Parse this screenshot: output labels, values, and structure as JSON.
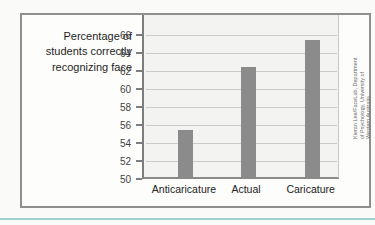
{
  "page": {
    "background": "#fafaf9",
    "bottom_rule_color": "#9fd1cd"
  },
  "figure": {
    "border_color": "#8f8f8f",
    "ylabel_lines": [
      "Percentage of",
      "students correctly",
      "recognizing face"
    ],
    "credit_lines": [
      "Kieran Lee/FaceLab, Department",
      "of Psychology, University of",
      "Western Australia"
    ]
  },
  "chart_data": {
    "type": "bar",
    "title": "",
    "xlabel": "",
    "ylabel": "Percentage of students correctly recognizing face",
    "categories": [
      "Anticaricature",
      "Actual",
      "Caricature"
    ],
    "values": [
      55.5,
      62.5,
      65.5
    ],
    "ylim": [
      50,
      66
    ],
    "yticks": [
      66,
      64,
      62,
      60,
      58,
      56,
      54,
      52,
      50
    ],
    "ytick_step": 2,
    "grid": true,
    "legend": false,
    "bar_color": "#8b8b8b",
    "plot_bg": "#f3f3f1",
    "gridline_color": "#cbcbc9",
    "axis_color": "#7d7d7d",
    "tick_label_color": "#3f3f3f",
    "category_label_color": "#222222",
    "credit_color": "#6e6e6e"
  }
}
